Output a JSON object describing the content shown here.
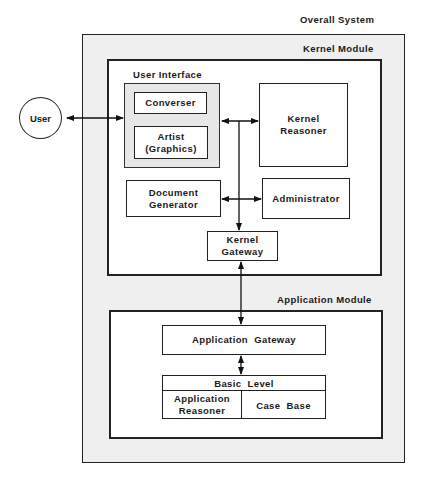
{
  "diagram": {
    "overall_label": "Overall System",
    "kernel_module_label": "Kernel Module",
    "application_module_label": "Application Module",
    "user": "User",
    "user_interface": {
      "label": "User Interface",
      "converser": "Converser",
      "artist": "Artist\n(Graphics)"
    },
    "kernel_reasoner": "Kernel\nReasoner",
    "document_generator": "Document\nGenerator",
    "administrator": "Administrator",
    "kernel_gateway": "Kernel\nGateway",
    "application_gateway": "Application  Gateway",
    "basic_level": {
      "label": "Basic  Level",
      "application_reasoner": "Application\nReasoner",
      "case_base": "Case  Base"
    },
    "connections": [
      {
        "from": "User",
        "to": "User Interface",
        "type": "bidirectional"
      },
      {
        "from": "User Interface",
        "to": "Kernel Reasoner",
        "type": "bidirectional"
      },
      {
        "from": "Document Generator",
        "to": "Administrator",
        "type": "bidirectional"
      },
      {
        "from": "User Interface bus",
        "to": "Kernel Gateway",
        "type": "directed"
      },
      {
        "from": "Kernel Gateway",
        "to": "Application Gateway",
        "type": "bidirectional"
      },
      {
        "from": "Application Gateway",
        "to": "Basic Level",
        "type": "bidirectional"
      }
    ]
  }
}
